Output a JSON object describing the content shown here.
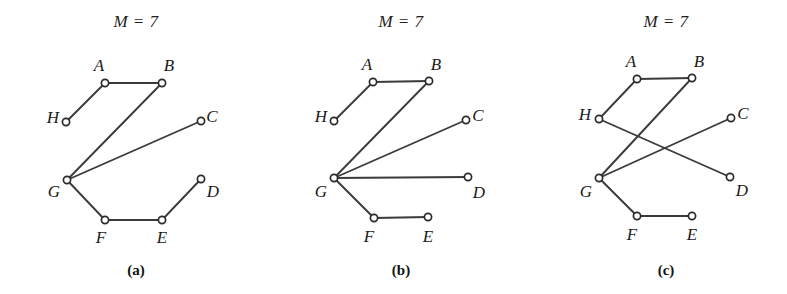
{
  "figure": {
    "width": 787,
    "height": 294,
    "background_color": "#ffffff",
    "edge_color": "#3b3b3b",
    "node_fill_color": "#ffffff",
    "node_stroke_color": "#2b2b2b",
    "node_radius": 3.6,
    "panels": [
      {
        "id": "panel-a",
        "title": "M = 7",
        "title_x": 136,
        "title_y": 12,
        "caption": "(a)",
        "caption_x": 136,
        "caption_y": 262,
        "nodes": [
          {
            "id": "A",
            "label": "A",
            "x": 105,
            "y": 83,
            "label_x": 99,
            "label_y": 66
          },
          {
            "id": "B",
            "label": "B",
            "x": 162,
            "y": 83,
            "label_x": 169,
            "label_y": 66
          },
          {
            "id": "C",
            "label": "C",
            "x": 201,
            "y": 121,
            "label_x": 212,
            "label_y": 117
          },
          {
            "id": "D",
            "label": "D",
            "x": 201,
            "y": 179,
            "label_x": 213,
            "label_y": 192
          },
          {
            "id": "E",
            "label": "E",
            "x": 162,
            "y": 220,
            "label_x": 162,
            "label_y": 238
          },
          {
            "id": "F",
            "label": "F",
            "x": 105,
            "y": 220,
            "label_x": 101,
            "label_y": 238
          },
          {
            "id": "G",
            "label": "G",
            "x": 67,
            "y": 180,
            "label_x": 54,
            "label_y": 192
          },
          {
            "id": "H",
            "label": "H",
            "x": 66,
            "y": 122,
            "label_x": 53,
            "label_y": 118
          }
        ],
        "edges": [
          {
            "from": "A",
            "to": "B"
          },
          {
            "from": "A",
            "to": "H"
          },
          {
            "from": "B",
            "to": "G"
          },
          {
            "from": "G",
            "to": "C"
          },
          {
            "from": "G",
            "to": "F"
          },
          {
            "from": "F",
            "to": "E"
          },
          {
            "from": "E",
            "to": "D"
          }
        ]
      },
      {
        "id": "panel-b",
        "title": "M = 7",
        "title_x": 401,
        "title_y": 12,
        "caption": "(b)",
        "caption_x": 401,
        "caption_y": 262,
        "nodes": [
          {
            "id": "A",
            "label": "A",
            "x": 373,
            "y": 82,
            "label_x": 367,
            "label_y": 65
          },
          {
            "id": "B",
            "label": "B",
            "x": 429,
            "y": 81,
            "label_x": 436,
            "label_y": 65
          },
          {
            "id": "C",
            "label": "C",
            "x": 466,
            "y": 120,
            "label_x": 478,
            "label_y": 116
          },
          {
            "id": "D",
            "label": "D",
            "x": 468,
            "y": 177,
            "label_x": 479,
            "label_y": 193
          },
          {
            "id": "E",
            "label": "E",
            "x": 428,
            "y": 217,
            "label_x": 428,
            "label_y": 237
          },
          {
            "id": "F",
            "label": "F",
            "x": 374,
            "y": 218,
            "label_x": 369,
            "label_y": 237
          },
          {
            "id": "G",
            "label": "G",
            "x": 334,
            "y": 178,
            "label_x": 321,
            "label_y": 192
          },
          {
            "id": "H",
            "label": "H",
            "x": 334,
            "y": 121,
            "label_x": 321,
            "label_y": 117
          }
        ],
        "edges": [
          {
            "from": "A",
            "to": "B"
          },
          {
            "from": "A",
            "to": "H"
          },
          {
            "from": "G",
            "to": "B"
          },
          {
            "from": "G",
            "to": "C"
          },
          {
            "from": "G",
            "to": "D"
          },
          {
            "from": "G",
            "to": "F"
          },
          {
            "from": "F",
            "to": "E"
          }
        ]
      },
      {
        "id": "panel-c",
        "title": "M = 7",
        "title_x": 666,
        "title_y": 12,
        "caption": "(c)",
        "caption_x": 666,
        "caption_y": 262,
        "nodes": [
          {
            "id": "A",
            "label": "A",
            "x": 637,
            "y": 79,
            "label_x": 631,
            "label_y": 62
          },
          {
            "id": "B",
            "label": "B",
            "x": 692,
            "y": 78,
            "label_x": 699,
            "label_y": 62
          },
          {
            "id": "C",
            "label": "C",
            "x": 731,
            "y": 118,
            "label_x": 743,
            "label_y": 114
          },
          {
            "id": "D",
            "label": "D",
            "x": 730,
            "y": 177,
            "label_x": 742,
            "label_y": 191
          },
          {
            "id": "E",
            "label": "E",
            "x": 692,
            "y": 216,
            "label_x": 692,
            "label_y": 235
          },
          {
            "id": "F",
            "label": "F",
            "x": 637,
            "y": 216,
            "label_x": 632,
            "label_y": 235
          },
          {
            "id": "G",
            "label": "G",
            "x": 599,
            "y": 178,
            "label_x": 586,
            "label_y": 192
          },
          {
            "id": "H",
            "label": "H",
            "x": 599,
            "y": 119,
            "label_x": 585,
            "label_y": 115
          }
        ],
        "edges": [
          {
            "from": "A",
            "to": "B"
          },
          {
            "from": "A",
            "to": "H"
          },
          {
            "from": "H",
            "to": "D"
          },
          {
            "from": "G",
            "to": "B"
          },
          {
            "from": "G",
            "to": "C"
          },
          {
            "from": "G",
            "to": "F"
          },
          {
            "from": "F",
            "to": "E"
          }
        ]
      }
    ]
  }
}
